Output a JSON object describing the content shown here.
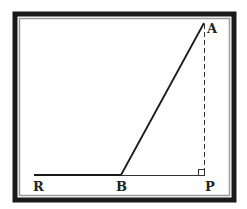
{
  "diagram": {
    "type": "geometry",
    "colors": {
      "frame_outer": "#1a1a1a",
      "frame_inner": "#9a9a9a",
      "line": "#1a1a1a",
      "label": "#222222",
      "background": "#ffffff"
    },
    "points": {
      "A": {
        "label": "A",
        "x": 204,
        "y": 23
      },
      "B": {
        "label": "B",
        "x": 121,
        "y": 175
      },
      "P": {
        "label": "P",
        "x": 205,
        "y": 175
      },
      "R": {
        "label": "R",
        "x": 34,
        "y": 175
      }
    },
    "segments": [
      {
        "from": "R",
        "to": "B",
        "style": "solid-thick"
      },
      {
        "from": "B",
        "to": "A",
        "style": "solid-thick"
      },
      {
        "from": "B",
        "to": "P",
        "style": "solid-thin"
      },
      {
        "from": "A",
        "to": "P",
        "style": "dashed"
      }
    ],
    "right_angle_at": "P",
    "labels": {
      "A": "A",
      "B": "B",
      "P": "P",
      "R": "R"
    }
  }
}
